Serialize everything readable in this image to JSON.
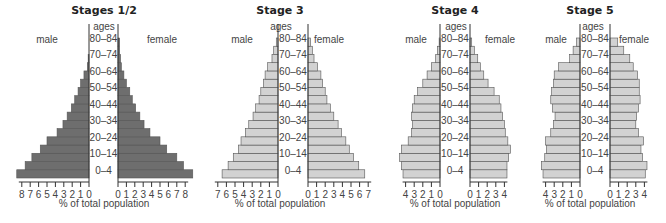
{
  "chart_data": [
    {
      "type": "bar",
      "subtype": "population-pyramid",
      "title": "Stages 1/2",
      "left_label": "male",
      "right_label": "female",
      "center_label": "ages",
      "xlabel": "% of total population",
      "age_labels_shown": [
        "80–84",
        "70–74",
        "60–64",
        "50–54",
        "40–44",
        "30–34",
        "20–24",
        "10–14",
        "0–4"
      ],
      "categories": [
        "0–4",
        "5–9",
        "10–14",
        "15–19",
        "20–24",
        "25–29",
        "30–34",
        "35–39",
        "40–44",
        "45–49",
        "50–54",
        "55–59",
        "60–64",
        "65–69",
        "70–74",
        "75–79",
        "80–84"
      ],
      "series": [
        {
          "name": "male",
          "values": [
            8.6,
            7.6,
            6.8,
            5.8,
            5.0,
            3.8,
            3.1,
            2.6,
            2.1,
            1.7,
            1.3,
            1.0,
            0.6,
            0.2,
            0.1,
            0.0,
            0.0
          ]
        },
        {
          "name": "female",
          "values": [
            8.9,
            7.8,
            7.0,
            5.8,
            5.0,
            3.8,
            3.1,
            2.6,
            2.1,
            1.7,
            1.4,
            1.0,
            0.7,
            0.4,
            0.3,
            0.2,
            0.2
          ]
        }
      ],
      "xlim_male": [
        0,
        8
      ],
      "xlim_female": [
        0,
        8
      ],
      "ticks": [
        0,
        1,
        2,
        3,
        4,
        5,
        6,
        7,
        8
      ],
      "bar_color": "#6e6e6e"
    },
    {
      "type": "bar",
      "subtype": "population-pyramid",
      "title": "Stage 3",
      "left_label": "male",
      "right_label": "female",
      "center_label": "ages",
      "xlabel": "% of total population",
      "age_labels_shown": [
        "80–84",
        "70–74",
        "60–64",
        "50–54",
        "40–44",
        "30–34",
        "20–24",
        "10–14",
        "0–4"
      ],
      "categories": [
        "0–4",
        "5–9",
        "10–14",
        "15–19",
        "20–24",
        "25–29",
        "30–34",
        "35–39",
        "40–44",
        "45–49",
        "50–54",
        "55–59",
        "60–64",
        "65–69",
        "70–74",
        "75–79",
        "80–84"
      ],
      "series": [
        {
          "name": "male",
          "values": [
            6.5,
            5.8,
            5.2,
            4.6,
            4.3,
            3.8,
            3.4,
            2.9,
            2.6,
            2.2,
            2.0,
            1.7,
            1.5,
            1.2,
            0.7,
            0.5,
            0.2
          ]
        },
        {
          "name": "female",
          "values": [
            6.6,
            5.9,
            5.3,
            4.8,
            4.4,
            3.9,
            3.5,
            3.0,
            2.6,
            2.2,
            2.0,
            1.7,
            1.5,
            1.1,
            0.7,
            0.5,
            0.3
          ]
        }
      ],
      "xlim_male": [
        0,
        7
      ],
      "xlim_female": [
        0,
        7
      ],
      "ticks": [
        0,
        1,
        2,
        3,
        4,
        5,
        6,
        7
      ],
      "bar_color": "#d2d2d2"
    },
    {
      "type": "bar",
      "subtype": "population-pyramid",
      "title": "Stage 4",
      "left_label": "male",
      "right_label": "female",
      "center_label": "ages",
      "xlabel": "% of total population",
      "age_labels_shown": [
        "80–84",
        "70–74",
        "60–64",
        "50–54",
        "40–44",
        "30–34",
        "20–24",
        "10–14",
        "0–4"
      ],
      "categories": [
        "0–4",
        "5–9",
        "10–14",
        "15–19",
        "20–24",
        "25–29",
        "30–34",
        "35–39",
        "40–44",
        "45–49",
        "50–54",
        "55–59",
        "60–64",
        "65–69",
        "70–74",
        "75–79",
        "80–84"
      ],
      "series": [
        {
          "name": "male",
          "values": [
            4.3,
            4.5,
            4.7,
            4.5,
            3.7,
            3.3,
            3.2,
            3.3,
            3.2,
            3.0,
            2.6,
            2.0,
            1.5,
            1.0,
            0.5,
            0.3,
            0.1
          ]
        },
        {
          "name": "female",
          "values": [
            4.3,
            4.3,
            4.5,
            4.7,
            4.4,
            4.1,
            4.0,
            3.8,
            3.6,
            3.4,
            2.8,
            2.1,
            1.6,
            1.2,
            0.9,
            0.5,
            0.2
          ]
        }
      ],
      "xlim_male": [
        0,
        4
      ],
      "xlim_female": [
        0,
        4
      ],
      "ticks": [
        0,
        1,
        2,
        3,
        4
      ],
      "bar_color": "#d2d2d2"
    },
    {
      "type": "bar",
      "subtype": "population-pyramid",
      "title": "Stage 5",
      "left_label": "male",
      "right_label": "female",
      "center_label": "ages",
      "xlabel": "% of total population",
      "age_labels_shown": [
        "80–84",
        "70–74",
        "60–64",
        "50–54",
        "40–44",
        "30–34",
        "20–24",
        "10–14",
        "0–4"
      ],
      "categories": [
        "0–4",
        "5–9",
        "10–14",
        "15–19",
        "20–24",
        "25–29",
        "30–34",
        "35–39",
        "40–44",
        "45–49",
        "50–54",
        "55–59",
        "60–64",
        "65–69",
        "70–74",
        "75–79",
        "80–84"
      ],
      "series": [
        {
          "name": "male",
          "values": [
            4.3,
            4.5,
            4.1,
            3.9,
            4.0,
            3.4,
            3.1,
            2.9,
            3.2,
            3.4,
            3.3,
            3.1,
            3.0,
            2.5,
            1.2,
            0.8,
            0.4
          ]
        },
        {
          "name": "female",
          "values": [
            4.1,
            4.3,
            3.8,
            3.6,
            3.9,
            3.3,
            3.0,
            3.1,
            3.3,
            3.5,
            3.4,
            3.4,
            3.2,
            2.7,
            2.3,
            1.6,
            0.9,
            0.4
          ]
        }
      ],
      "xlim_male": [
        0,
        4
      ],
      "xlim_female": [
        0,
        4
      ],
      "ticks": [
        0,
        1,
        2,
        3,
        4
      ],
      "bar_color": "#d2d2d2"
    }
  ]
}
